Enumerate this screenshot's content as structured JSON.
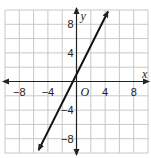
{
  "chart_data": {
    "type": "line",
    "title": "",
    "xlabel": "x",
    "ylabel": "y",
    "origin_label": "O",
    "xlim": [
      -10,
      10
    ],
    "ylim": [
      -10,
      10
    ],
    "grid": true,
    "grid_step": 2,
    "x_ticks": [
      -8,
      -4,
      4,
      8
    ],
    "y_ticks": [
      8,
      4,
      -4,
      -8
    ],
    "x_tick_labels": [
      "−8",
      "−4",
      "4",
      "8"
    ],
    "y_tick_labels": [
      "8",
      "4",
      "−4",
      "−8"
    ],
    "series": [
      {
        "name": "line",
        "equation": "y = 2x + 1",
        "slope": 2,
        "intercept": 1,
        "x": [
          -5.3,
          4.4
        ],
        "y": [
          -9.6,
          9.8
        ],
        "arrows_both_ends": true
      }
    ],
    "colors": {
      "grid": "#c8c8c8",
      "axis": "#222222",
      "line": "#111111"
    }
  }
}
